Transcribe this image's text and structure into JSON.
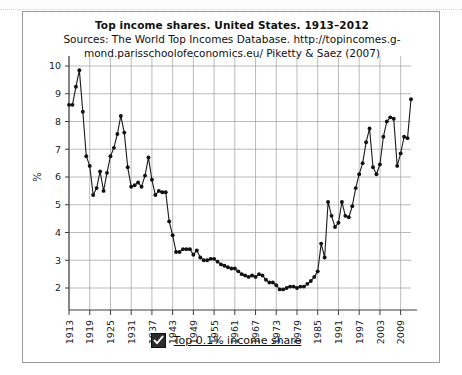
{
  "window": {
    "panel_name": "chart-panel"
  },
  "header": {
    "title": "Top income shares. United States. 1913–2012",
    "subtitle": "Sources: The World Top Incomes Database. http://topincomes.g-mond.parisschoolofeconomics.eu/ Piketty & Saez (2007)"
  },
  "legend": {
    "checkbox_state": "checked",
    "checkbox_icon": "check-icon",
    "label": "Top 0.1% income share"
  },
  "axes": {
    "y_label": "%",
    "y_ticks": [
      "2",
      "3",
      "4",
      "5",
      "6",
      "7",
      "8",
      "9",
      "10"
    ],
    "x_ticks": [
      "1913",
      "1919",
      "1925",
      "1931",
      "1937",
      "1943",
      "1949",
      "1955",
      "1961",
      "1967",
      "1973",
      "1979",
      "1985",
      "1991",
      "1997",
      "2003",
      "2009"
    ]
  },
  "style": {
    "line_color": "#1a1a1a",
    "marker_color": "#111111",
    "grid_color": "#9e9e9e",
    "axis_color": "#3c3c3c",
    "panel_border": "#9a9a9a",
    "background": "#ffffff"
  },
  "chart_data": {
    "type": "line",
    "title": "Top income shares. United States. 1913–2012",
    "subtitle": "Sources: The World Top Incomes Database. http://topincomes.g-mond.parisschoolofeconomics.eu/ Piketty & Saez (2007)",
    "xlabel": "",
    "ylabel": "%",
    "xlim": [
      1913,
      2012
    ],
    "ylim": [
      1.5,
      10.2
    ],
    "grid": true,
    "legend_position": "bottom-center",
    "series": [
      {
        "name": "Top 0.1% income share",
        "x": [
          1913,
          1914,
          1915,
          1916,
          1917,
          1918,
          1919,
          1920,
          1921,
          1922,
          1923,
          1924,
          1925,
          1926,
          1927,
          1928,
          1929,
          1930,
          1931,
          1932,
          1933,
          1934,
          1935,
          1936,
          1937,
          1938,
          1939,
          1940,
          1941,
          1942,
          1943,
          1944,
          1945,
          1946,
          1947,
          1948,
          1949,
          1950,
          1951,
          1952,
          1953,
          1954,
          1955,
          1956,
          1957,
          1958,
          1959,
          1960,
          1961,
          1962,
          1963,
          1964,
          1965,
          1966,
          1967,
          1968,
          1969,
          1970,
          1971,
          1972,
          1973,
          1974,
          1975,
          1976,
          1977,
          1978,
          1979,
          1980,
          1981,
          1982,
          1983,
          1984,
          1985,
          1986,
          1987,
          1988,
          1989,
          1990,
          1991,
          1992,
          1993,
          1994,
          1995,
          1996,
          1997,
          1998,
          1999,
          2000,
          2001,
          2002,
          2003,
          2004,
          2005,
          2006,
          2007,
          2008,
          2009,
          2010,
          2011,
          2012
        ],
        "values": [
          8.6,
          8.6,
          9.25,
          9.85,
          8.35,
          6.75,
          6.4,
          5.35,
          5.6,
          6.2,
          5.5,
          6.15,
          6.75,
          7.05,
          7.55,
          8.2,
          7.6,
          6.35,
          5.65,
          5.7,
          5.8,
          5.65,
          6.05,
          6.7,
          5.9,
          5.35,
          5.5,
          5.45,
          5.45,
          4.4,
          3.9,
          3.3,
          3.3,
          3.4,
          3.4,
          3.4,
          3.2,
          3.35,
          3.1,
          3.0,
          3.0,
          3.05,
          3.05,
          2.95,
          2.85,
          2.8,
          2.75,
          2.7,
          2.7,
          2.6,
          2.5,
          2.45,
          2.4,
          2.45,
          2.4,
          2.5,
          2.45,
          2.3,
          2.2,
          2.2,
          2.1,
          1.95,
          1.95,
          2.0,
          2.05,
          2.05,
          2.0,
          2.05,
          2.05,
          2.15,
          2.25,
          2.4,
          2.6,
          3.6,
          3.1,
          5.1,
          4.6,
          4.2,
          4.35,
          5.1,
          4.6,
          4.55,
          4.95,
          5.6,
          6.1,
          6.5,
          7.25,
          7.75,
          6.35,
          6.1,
          6.45,
          7.45,
          8.0,
          8.15,
          8.1,
          6.4,
          6.85,
          7.45,
          7.4,
          8.8
        ]
      }
    ]
  }
}
